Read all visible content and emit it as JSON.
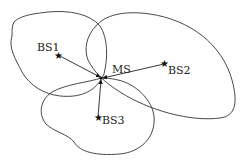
{
  "diagram": {
    "type": "network-coverage",
    "nodes": [
      {
        "id": "BS1",
        "label": "BS1",
        "kind": "base-station",
        "x": 58,
        "y": 55
      },
      {
        "id": "BS2",
        "label": "BS2",
        "kind": "base-station",
        "x": 164,
        "y": 64
      },
      {
        "id": "BS3",
        "label": "BS3",
        "kind": "base-station",
        "x": 98,
        "y": 117
      },
      {
        "id": "MS",
        "label": "MS",
        "kind": "mobile-station",
        "x": 101,
        "y": 78
      }
    ],
    "edges": [
      {
        "from": "BS1",
        "to": "MS"
      },
      {
        "from": "BS2",
        "to": "MS"
      },
      {
        "from": "BS3",
        "to": "MS"
      }
    ],
    "coverage_regions": 3,
    "colors": {
      "line": "#333333",
      "star": "#111111",
      "background": "#ffffff"
    }
  }
}
